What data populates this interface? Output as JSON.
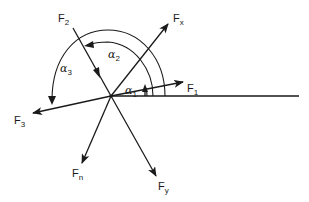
{
  "diagram": {
    "type": "force-vector-diagram",
    "stroke_color": "#1a1a1a",
    "background": "#ffffff",
    "origin": [
      111,
      96
    ],
    "reference_line": {
      "from": [
        111,
        96
      ],
      "to": [
        299,
        96
      ]
    },
    "forces": [
      {
        "id": "F1",
        "symbol": "F",
        "subscript": "1",
        "tip": [
          183,
          82
        ],
        "label_pos": [
          187,
          92
        ]
      },
      {
        "id": "Fx",
        "symbol": "F",
        "subscript": "x",
        "tip": [
          168,
          24
        ],
        "label_pos": [
          173,
          22
        ]
      },
      {
        "id": "F2",
        "symbol": "F",
        "subscript": "2",
        "start": [
          73,
          28
        ],
        "arrow_toward_origin": true,
        "label_pos": [
          58,
          22
        ]
      },
      {
        "id": "F3",
        "symbol": "F",
        "subscript": "3",
        "tip": [
          33,
          113
        ],
        "label_pos": [
          14,
          124
        ]
      },
      {
        "id": "Fn",
        "symbol": "F",
        "subscript": "n",
        "tip": [
          82,
          163
        ],
        "label_pos": [
          72,
          177
        ]
      },
      {
        "id": "Fy",
        "symbol": "F",
        "subscript": "y",
        "tip": [
          156,
          176
        ],
        "label_pos": [
          158,
          190
        ]
      }
    ],
    "angles": [
      {
        "id": "alpha1",
        "symbol": "α",
        "subscript": "1",
        "from": "horizontal",
        "to": "F1",
        "label_pos": [
          124,
          93
        ]
      },
      {
        "id": "alpha2",
        "symbol": "α",
        "subscript": "2",
        "from": "F1",
        "to": "F2",
        "label_pos": [
          108,
          56
        ]
      },
      {
        "id": "alpha3",
        "symbol": "α",
        "subscript": "3",
        "from": "horizontal",
        "to": "F3",
        "label_pos": [
          60,
          72
        ]
      }
    ]
  },
  "labels": {
    "F1": {
      "main": "F",
      "sub": "1"
    },
    "Fx": {
      "main": "F",
      "sub": "x"
    },
    "F2": {
      "main": "F",
      "sub": "2"
    },
    "F3": {
      "main": "F",
      "sub": "3"
    },
    "Fn": {
      "main": "F",
      "sub": "n"
    },
    "Fy": {
      "main": "F",
      "sub": "y"
    },
    "alpha1": {
      "main": "α",
      "sub": "1"
    },
    "alpha2": {
      "main": "α",
      "sub": "2"
    },
    "alpha3": {
      "main": "α",
      "sub": "3"
    }
  }
}
